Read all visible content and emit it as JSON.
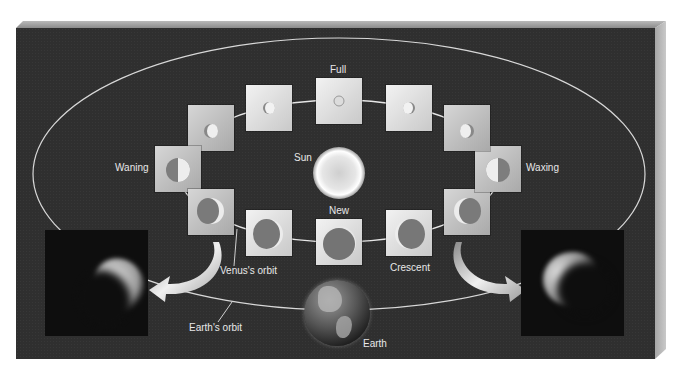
{
  "diagram": {
    "labels": {
      "full": "Full",
      "new": "New",
      "sun": "Sun",
      "waning": "Waning",
      "waxing": "Waxing",
      "crescent": "Crescent",
      "venus_orbit": "Venus's orbit",
      "earth_orbit": "Earth's orbit",
      "earth": "Earth"
    },
    "phases": [
      {
        "name": "full",
        "position": "top"
      },
      {
        "name": "gibbous-left-1",
        "position": "upper-left"
      },
      {
        "name": "gibbous-left-2",
        "position": "left-upper"
      },
      {
        "name": "waning-half",
        "position": "left"
      },
      {
        "name": "crescent-left",
        "position": "lower-left"
      },
      {
        "name": "crescent-left-2",
        "position": "bottom-left"
      },
      {
        "name": "new",
        "position": "bottom"
      },
      {
        "name": "crescent",
        "position": "bottom-right"
      },
      {
        "name": "crescent-right",
        "position": "lower-right"
      },
      {
        "name": "waxing-half",
        "position": "right"
      },
      {
        "name": "gibbous-right-2",
        "position": "right-upper"
      },
      {
        "name": "gibbous-right-1",
        "position": "upper-right"
      }
    ],
    "photos": [
      {
        "name": "venus-crescent-photo-left",
        "side": "left"
      },
      {
        "name": "venus-crescent-photo-right",
        "side": "right"
      }
    ],
    "colors": {
      "background": "#2f2f2f",
      "orbit_line": "#e0e0e0",
      "square_fill": "#e6e6e6",
      "venus_dark": "#7a7a7a",
      "venus_lit": "#e8e8e8"
    }
  }
}
